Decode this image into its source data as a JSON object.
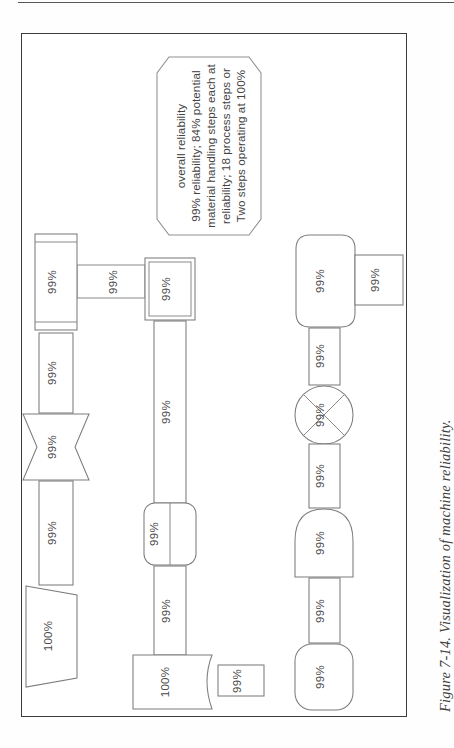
{
  "page": {
    "figure_caption": "Figure 7-14. Visualization of machine reliability."
  },
  "callout": {
    "name": "reliability-callout",
    "lines": [
      "Two steps operating at 100%",
      "reliability; 18 process steps or",
      "material handling steps each at",
      "99% reliability; 84% potential",
      "overall reliability"
    ],
    "full_text": "Two steps operating at 100% reliability; 18 process steps or material handling steps each at 99% reliability; 84% potential overall reliability"
  },
  "diagram": {
    "title": "Visualization of machine reliability",
    "orientation": "rotated-90-ccw",
    "rows": [
      {
        "name": "row-1",
        "nodes": [
          {
            "id": "r1-n1",
            "shape": "predefined-process",
            "label": "99%"
          },
          {
            "id": "r1-n2",
            "shape": "process-rectangle",
            "label": "99%"
          },
          {
            "id": "r1-n3",
            "shape": "bowtie-merge",
            "label": "99%"
          },
          {
            "id": "r1-n4",
            "shape": "process-rectangle",
            "label": "99%"
          },
          {
            "id": "r1-n5",
            "shape": "trapezoid-manual",
            "label": "100%"
          }
        ],
        "branch": {
          "id": "r1-b1",
          "shape": "process-rectangle",
          "label": "99%"
        }
      },
      {
        "name": "row-2",
        "nodes": [
          {
            "id": "r2-n1",
            "shape": "double-rectangle",
            "label": "99%"
          },
          {
            "id": "r2-n2",
            "shape": "process-rectangle",
            "label": "99%"
          },
          {
            "id": "r2-n3",
            "shape": "rounded-split-rectangle",
            "label": "99%"
          },
          {
            "id": "r2-n4",
            "shape": "process-rectangle",
            "label": "99%"
          },
          {
            "id": "r2-n5",
            "shape": "document",
            "label": "100%"
          }
        ],
        "branch": {
          "id": "r2-b1",
          "shape": "process-rectangle",
          "label": "99%"
        }
      },
      {
        "name": "row-3",
        "nodes": [
          {
            "id": "r3-n1",
            "shape": "hexagon-prepare",
            "label": "99%"
          },
          {
            "id": "r3-n2",
            "shape": "process-rectangle",
            "label": "99%"
          },
          {
            "id": "r3-n3",
            "shape": "circle-summing",
            "label": "99%"
          },
          {
            "id": "r3-n4",
            "shape": "process-rectangle",
            "label": "99%"
          },
          {
            "id": "r3-n5",
            "shape": "delay-d",
            "label": "99%"
          },
          {
            "id": "r3-n6",
            "shape": "process-rectangle",
            "label": "99%"
          },
          {
            "id": "r3-n7",
            "shape": "rounded-terminator",
            "label": "99%"
          }
        ],
        "branch": {
          "id": "r3-b1",
          "shape": "process-rectangle",
          "label": "99%"
        }
      }
    ]
  },
  "colors": {
    "frame_stroke": "#3b3b3b",
    "shape_stroke": "#7c7c7c",
    "text": "#4a4a4a",
    "caption_text": "#3f3f3f",
    "background": "#ffffff"
  }
}
